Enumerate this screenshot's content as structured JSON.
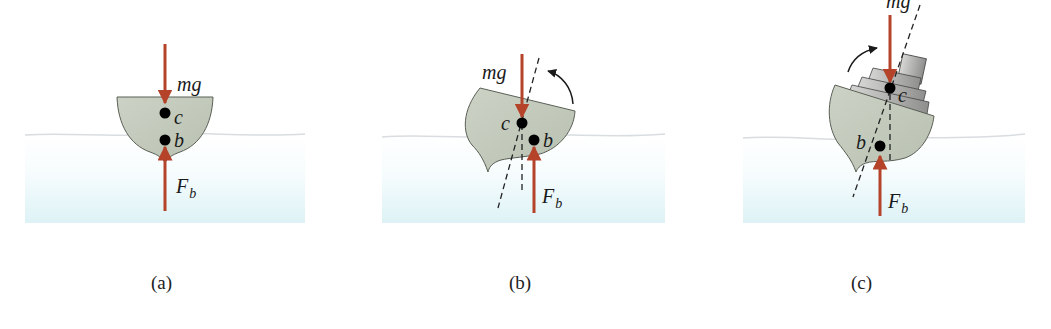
{
  "figure": {
    "panels": [
      {
        "id": "a",
        "caption": "(a)",
        "description": "Upright hull; center of gravity c directly above center of buoyancy b",
        "labels": {
          "weight": "mg",
          "buoyancy_main": "F",
          "buoyancy_sub": "b",
          "gravity_point": "c",
          "buoyancy_point": "b"
        }
      },
      {
        "id": "b",
        "caption": "(b)",
        "description": "Tilted hull; buoyancy shifts producing restoring torque (counter-clockwise arrow)",
        "labels": {
          "weight": "mg",
          "buoyancy_main": "F",
          "buoyancy_sub": "b",
          "gravity_point": "c",
          "buoyancy_point": "b"
        }
      },
      {
        "id": "c",
        "caption": "(c)",
        "description": "Top-heavy tilted ship; torque increases tilt (clockwise arrow)",
        "labels": {
          "weight": "mg",
          "buoyancy_main": "F",
          "buoyancy_sub": "b",
          "gravity_point": "c",
          "buoyancy_point": "b"
        }
      }
    ],
    "colors": {
      "force_arrow": "#b5432a",
      "hull_fill": "#c4cbbd",
      "hull_stroke": "#5a5f55",
      "water_top": "#ffffff",
      "water_bottom": "#e3f5f8",
      "waterline": "#d9dde0",
      "point": "#000000"
    }
  }
}
